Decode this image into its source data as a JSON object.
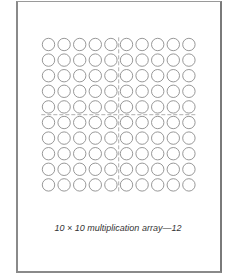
{
  "figure": {
    "caption": "10 × 10 multiplication array—12",
    "rows": 10,
    "columns": 10,
    "row_divider_after": 5,
    "column_divider_after": 5,
    "colors": {
      "circle_stroke": "#8c8c8c",
      "divider": "#9a9a9a",
      "frame": "#8a8a8a"
    }
  }
}
